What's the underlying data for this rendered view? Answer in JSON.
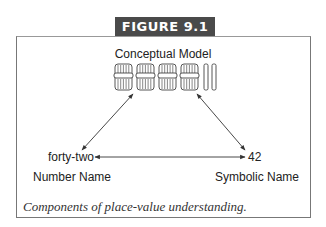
{
  "figure": {
    "label": "FIGURE 9.1",
    "caption": "Components of place-value understanding."
  },
  "diagram": {
    "top_node": {
      "title": "Conceptual Model",
      "model": {
        "tens_bundles": 4,
        "single_units": 2
      }
    },
    "left_node": {
      "value": "forty-two",
      "label": "Number Name"
    },
    "right_node": {
      "value": "42",
      "label": "Symbolic Name"
    },
    "connections": [
      {
        "from": "Conceptual Model",
        "to": "Number Name",
        "type": "bidirectional"
      },
      {
        "from": "Conceptual Model",
        "to": "Symbolic Name",
        "type": "bidirectional"
      },
      {
        "from": "Number Name",
        "to": "Symbolic Name",
        "type": "bidirectional"
      }
    ]
  }
}
